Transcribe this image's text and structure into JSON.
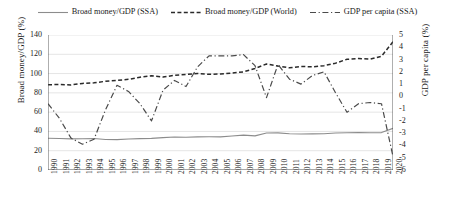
{
  "legend": {
    "items": [
      {
        "label": "Broad money/GDP (SSA)",
        "style": "solid",
        "color": "#8c8c8c",
        "icon": "line-solid-icon"
      },
      {
        "label": "Broad money/GDP (World)",
        "style": "dashed",
        "color": "#2a2a2a",
        "icon": "line-dashed-icon"
      },
      {
        "label": "GDP per capita (SSA)",
        "style": "dashdot",
        "color": "#4a4a4a",
        "icon": "line-dashdot-icon"
      }
    ]
  },
  "chart_data": {
    "type": "line",
    "title": "",
    "xlabel": "",
    "ylabel": "Broad money/GDP (%)",
    "y2label": "GDP per capita (%)",
    "ylim": [
      0,
      140
    ],
    "y2lim": [
      -6,
      5
    ],
    "yticks": [
      0,
      20,
      40,
      60,
      80,
      100,
      120,
      140
    ],
    "y2ticks": [
      -6,
      -5,
      -4,
      -3,
      -2,
      -1,
      0,
      1,
      2,
      3,
      4,
      5
    ],
    "grid": true,
    "legend_position": "top",
    "categories": [
      "1990",
      "1991",
      "1992",
      "1993",
      "1994",
      "1995",
      "1996",
      "1997",
      "1998",
      "1999",
      "2000",
      "2001",
      "2002",
      "2003",
      "2004",
      "2005",
      "2006",
      "2007",
      "2008",
      "2009",
      "2010",
      "2011",
      "2012",
      "2013",
      "2014",
      "2015",
      "2016",
      "2017",
      "2018",
      "2019",
      "2020"
    ],
    "series": [
      {
        "name": "Broad money/GDP (SSA)",
        "axis": "left",
        "style": "solid",
        "color": "#8c8c8c",
        "values": [
          33.0,
          32.6,
          32.3,
          32.4,
          32.6,
          31.7,
          31.5,
          32.2,
          32.5,
          32.8,
          33.6,
          34.2,
          34.0,
          34.4,
          34.5,
          34.4,
          35.2,
          36.2,
          35.4,
          38.4,
          38.5,
          37.6,
          37.3,
          37.5,
          37.6,
          38.4,
          38.6,
          38.8,
          38.6,
          38.8,
          43.2
        ]
      },
      {
        "name": "Broad money/GDP (World)",
        "axis": "left",
        "style": "dashed",
        "color": "#2a2a2a",
        "values": [
          88.5,
          88.6,
          88.2,
          89.8,
          90.4,
          92.0,
          93.0,
          94.0,
          96.3,
          97.7,
          96.4,
          98.2,
          99.1,
          100.0,
          99.3,
          99.6,
          100.6,
          101.8,
          105.3,
          109.9,
          107.8,
          106.0,
          107.4,
          107.0,
          108.2,
          110.8,
          114.8,
          115.6,
          114.9,
          118.0,
          133.0
        ]
      },
      {
        "name": "GDP per capita (SSA)",
        "axis": "right",
        "style": "dashdot",
        "color": "#4a4a4a",
        "values": [
          -0.6,
          -1.8,
          -3.4,
          -3.9,
          -3.5,
          -1.1,
          0.9,
          0.4,
          -0.6,
          -2.0,
          0.5,
          1.3,
          0.8,
          2.4,
          3.3,
          3.3,
          3.3,
          3.4,
          2.5,
          -0.1,
          2.6,
          1.4,
          1.0,
          1.7,
          2.0,
          0.3,
          -1.3,
          -0.6,
          -0.5,
          -0.6,
          -4.9
        ]
      }
    ]
  }
}
